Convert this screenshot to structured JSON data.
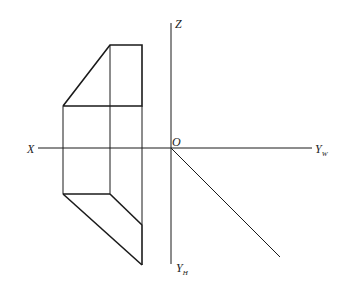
{
  "labels": {
    "x": "X",
    "z": "Z",
    "o": "O",
    "yw": "Y",
    "yw_sub": "W",
    "yh": "Y",
    "yh_sub": "H"
  },
  "colors": {
    "line": "#1a1a1a",
    "background": "#ffffff"
  }
}
